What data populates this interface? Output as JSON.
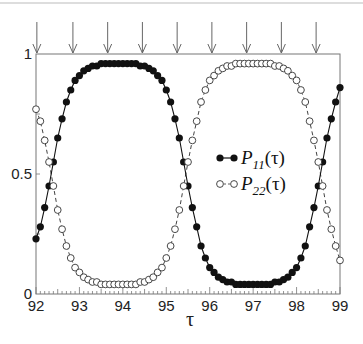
{
  "chart_data": {
    "type": "line",
    "title": "",
    "xlabel": "τ",
    "ylabel": "",
    "xlim": [
      92,
      99
    ],
    "ylim": [
      0,
      1
    ],
    "x_ticks": [
      "92",
      "93",
      "94",
      "95",
      "96",
      "97",
      "98",
      "99"
    ],
    "y_ticks": [
      "0",
      "0.5",
      "1"
    ],
    "grid": false,
    "legend_position": "center-right inside",
    "arrow_markers_tau": [
      92.02,
      92.85,
      93.65,
      94.45,
      95.25,
      96.05,
      96.85,
      97.65,
      98.45
    ],
    "x": [
      92.0,
      92.1,
      92.2,
      92.3,
      92.4,
      92.5,
      92.6,
      92.7,
      92.8,
      92.9,
      93.0,
      93.1,
      93.2,
      93.3,
      93.4,
      93.5,
      93.6,
      93.7,
      93.8,
      93.9,
      94.0,
      94.1,
      94.2,
      94.3,
      94.4,
      94.5,
      94.6,
      94.7,
      94.8,
      94.9,
      95.0,
      95.1,
      95.2,
      95.3,
      95.4,
      95.5,
      95.6,
      95.7,
      95.8,
      95.9,
      96.0,
      96.1,
      96.2,
      96.3,
      96.4,
      96.5,
      96.6,
      96.7,
      96.8,
      96.9,
      97.0,
      97.1,
      97.2,
      97.3,
      97.4,
      97.5,
      97.6,
      97.7,
      97.8,
      97.9,
      98.0,
      98.1,
      98.2,
      98.3,
      98.4,
      98.5,
      98.6,
      98.7,
      98.8,
      98.9,
      99.0
    ],
    "series": [
      {
        "name": "P11(τ)",
        "marker": "filled-circle",
        "line": "solid",
        "values": [
          0.23,
          0.28,
          0.36,
          0.45,
          0.55,
          0.65,
          0.73,
          0.8,
          0.85,
          0.89,
          0.91,
          0.93,
          0.94,
          0.95,
          0.95,
          0.96,
          0.96,
          0.96,
          0.96,
          0.96,
          0.96,
          0.96,
          0.96,
          0.96,
          0.95,
          0.95,
          0.94,
          0.93,
          0.91,
          0.89,
          0.85,
          0.8,
          0.73,
          0.65,
          0.55,
          0.45,
          0.36,
          0.28,
          0.2,
          0.15,
          0.11,
          0.09,
          0.07,
          0.06,
          0.05,
          0.05,
          0.04,
          0.04,
          0.04,
          0.04,
          0.04,
          0.04,
          0.04,
          0.04,
          0.04,
          0.05,
          0.05,
          0.06,
          0.07,
          0.09,
          0.11,
          0.15,
          0.2,
          0.28,
          0.36,
          0.45,
          0.55,
          0.65,
          0.73,
          0.8,
          0.86
        ]
      },
      {
        "name": "P22(τ)",
        "marker": "open-circle",
        "line": "dashed",
        "values": [
          0.77,
          0.72,
          0.64,
          0.55,
          0.45,
          0.35,
          0.27,
          0.2,
          0.15,
          0.11,
          0.09,
          0.07,
          0.06,
          0.05,
          0.05,
          0.04,
          0.04,
          0.04,
          0.04,
          0.04,
          0.04,
          0.04,
          0.04,
          0.04,
          0.05,
          0.05,
          0.06,
          0.07,
          0.09,
          0.11,
          0.15,
          0.2,
          0.27,
          0.35,
          0.45,
          0.55,
          0.64,
          0.72,
          0.8,
          0.85,
          0.89,
          0.91,
          0.93,
          0.94,
          0.95,
          0.95,
          0.96,
          0.96,
          0.96,
          0.96,
          0.96,
          0.96,
          0.96,
          0.96,
          0.96,
          0.95,
          0.95,
          0.94,
          0.93,
          0.91,
          0.89,
          0.85,
          0.8,
          0.72,
          0.64,
          0.55,
          0.45,
          0.35,
          0.27,
          0.2,
          0.14
        ]
      }
    ]
  },
  "legend": {
    "p11_main": "P",
    "p11_sub": "11",
    "p11_arg": "(τ)",
    "p22_main": "P",
    "p22_sub": "22",
    "p22_arg": "(τ)"
  }
}
